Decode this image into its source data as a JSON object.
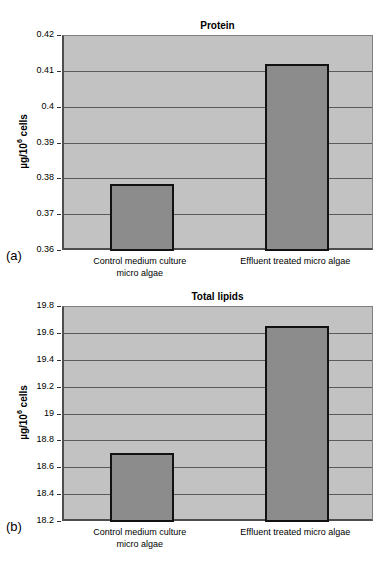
{
  "panels": [
    {
      "letter": "(a)"
    },
    {
      "letter": "(b)"
    }
  ],
  "chart_data": [
    {
      "type": "bar",
      "title": "Protein",
      "xlabel": "",
      "ylabel": "µg/10⁶ cells",
      "ylabel_base": "µg/10",
      "ylabel_exp": "6",
      "ylabel_tail": " cells",
      "categories": [
        "Control medium culture micro algae",
        "Effluent treated micro algae"
      ],
      "category_lines": [
        [
          "Control medium culture",
          "micro algae"
        ],
        [
          "Effluent treated micro algae",
          ""
        ]
      ],
      "values": [
        0.3788,
        0.4122
      ],
      "ylim": [
        0.36,
        0.42
      ],
      "ytick_step": 0.01,
      "yticks": [
        0.42,
        0.41,
        0.4,
        0.39,
        0.38,
        0.37,
        0.36
      ],
      "ytick_labels": [
        "0.42",
        "0.41",
        "0.4",
        "0.39",
        "0.38",
        "0.37",
        "0.36"
      ],
      "grid": true,
      "legend": "none",
      "bar_color": "#8c8c8c",
      "plot_bg": "#c2c2c2",
      "bar_edge_color": "#111111"
    },
    {
      "type": "bar",
      "title": "Total lipids",
      "xlabel": "",
      "ylabel": "µg/10⁶ cells",
      "ylabel_base": "µg/10",
      "ylabel_exp": "6",
      "ylabel_tail": " cells",
      "categories": [
        "Control medium culture micro algae",
        "Effluent treated micro algae"
      ],
      "category_lines": [
        [
          "Control medium culture",
          "micro algae"
        ],
        [
          "Effluent treated micro algae",
          ""
        ]
      ],
      "values": [
        18.71,
        19.66
      ],
      "ylim": [
        18.2,
        19.8
      ],
      "ytick_step": 0.2,
      "yticks": [
        19.8,
        19.6,
        19.4,
        19.2,
        19.0,
        18.8,
        18.6,
        18.4,
        18.2
      ],
      "ytick_labels": [
        "19.8",
        "19.6",
        "19.4",
        "19.2",
        "19",
        "18.8",
        "18.6",
        "18.4",
        "18.2"
      ],
      "grid": true,
      "legend": "none",
      "bar_color": "#8c8c8c",
      "plot_bg": "#c2c2c2",
      "bar_edge_color": "#111111"
    }
  ]
}
